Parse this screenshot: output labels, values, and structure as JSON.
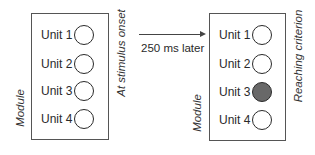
{
  "diagram": {
    "panels": [
      {
        "module_label": "Module",
        "state_label": "At stimulus onset",
        "units": [
          {
            "label": "Unit 1",
            "active": false
          },
          {
            "label": "Unit 2",
            "active": false
          },
          {
            "label": "Unit 3",
            "active": false
          },
          {
            "label": "Unit 4",
            "active": false
          }
        ]
      },
      {
        "module_label": "Module",
        "state_label": "Reaching criterion",
        "units": [
          {
            "label": "Unit 1",
            "active": false
          },
          {
            "label": "Unit 2",
            "active": false
          },
          {
            "label": "Unit 3",
            "active": true
          },
          {
            "label": "Unit 4",
            "active": false
          }
        ]
      }
    ],
    "transition": {
      "label": "250 ms later",
      "arrow": "right-arrow"
    },
    "colors": {
      "active_fill": "#686868",
      "inactive_fill": "#ffffff",
      "stroke": "#2a2a2a"
    }
  }
}
